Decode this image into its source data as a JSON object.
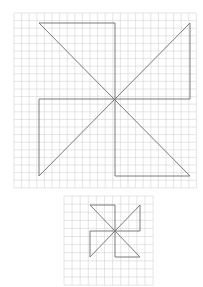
{
  "figures": [
    {
      "name": "large-pinwheel",
      "grid": {
        "x": 14,
        "y": 13,
        "cols": 24,
        "rows": 23,
        "cell": 7.6,
        "color": "#d4d4d4"
      },
      "lines": [
        [
          39,
          23,
          190,
          176
        ],
        [
          190,
          23,
          39,
          176
        ],
        [
          39,
          23,
          115,
          23
        ],
        [
          115,
          23,
          115,
          99
        ],
        [
          190,
          23,
          190,
          99
        ],
        [
          190,
          99,
          115,
          99
        ],
        [
          39,
          99,
          115,
          99
        ],
        [
          39,
          99,
          39,
          176
        ],
        [
          115,
          99,
          115,
          176
        ],
        [
          115,
          176,
          190,
          176
        ]
      ],
      "stroke": "#7a7a7a"
    },
    {
      "name": "small-pinwheel",
      "grid": {
        "x": 64,
        "y": 196,
        "cols": 11,
        "rows": 11,
        "cell": 8.1,
        "color": "#d4d4d4"
      },
      "lines": [
        [
          90,
          205,
          140,
          257
        ],
        [
          140,
          205,
          90,
          257
        ],
        [
          90,
          205,
          115,
          205
        ],
        [
          115,
          205,
          115,
          231
        ],
        [
          140,
          205,
          140,
          231
        ],
        [
          140,
          231,
          115,
          231
        ],
        [
          90,
          231,
          115,
          231
        ],
        [
          90,
          231,
          90,
          257
        ],
        [
          115,
          231,
          115,
          257
        ],
        [
          115,
          257,
          140,
          257
        ]
      ],
      "stroke": "#7a7a7a"
    }
  ]
}
